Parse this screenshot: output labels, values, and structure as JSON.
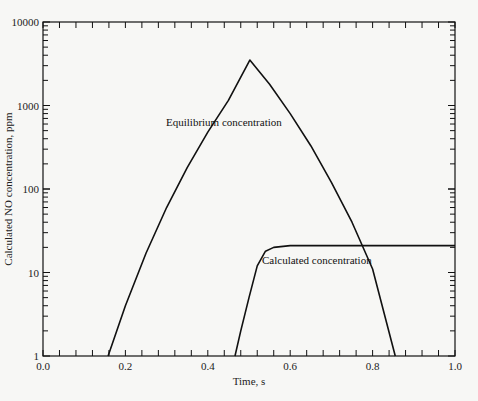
{
  "chart_data": {
    "type": "line",
    "title": "",
    "xlabel": "Time, s",
    "ylabel": "Calculated NO concentration, ppm",
    "xlim": [
      0.0,
      1.0
    ],
    "ylim": [
      1,
      10000
    ],
    "yscale": "log",
    "grid": false,
    "legend": "none (inline annotations)",
    "x_ticks": [
      "0.0",
      "0.2",
      "0.4",
      "0.6",
      "0.8",
      "1.0"
    ],
    "y_ticks": [
      "1",
      "10",
      "100",
      "1000",
      "10000"
    ],
    "series": [
      {
        "name": "Equilibrium concentration",
        "x": [
          0.158,
          0.2,
          0.25,
          0.3,
          0.35,
          0.4,
          0.45,
          0.502,
          0.55,
          0.6,
          0.65,
          0.7,
          0.75,
          0.8,
          0.855
        ],
        "y": [
          1,
          4,
          17,
          60,
          180,
          480,
          1150,
          3500,
          1800,
          800,
          330,
          120,
          40,
          11,
          1
        ]
      },
      {
        "name": "Calculated concentration",
        "x": [
          0.466,
          0.48,
          0.5,
          0.52,
          0.54,
          0.56,
          0.6,
          0.7,
          0.8,
          0.9,
          1.0
        ],
        "y": [
          1,
          2,
          5,
          12,
          18,
          20,
          21,
          21,
          21,
          21,
          21
        ]
      }
    ],
    "annotations": [
      {
        "text": "Equilibrium concentration",
        "x": 0.35,
        "y": 600
      },
      {
        "text": "Calculated concentration",
        "x": 0.64,
        "y": 12
      }
    ]
  },
  "labels": {
    "xlabel": "Time, s",
    "ylabel": "Calculated NO concentration, ppm",
    "eq_annot": "Equilibrium concentration",
    "calc_annot": "Calculated concentration"
  }
}
